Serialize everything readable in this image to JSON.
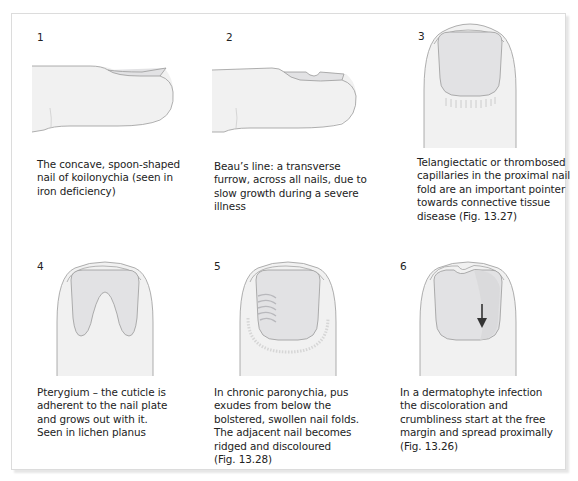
{
  "figure": {
    "panels": [
      {
        "number": "1",
        "illustration": "koilonychia-finger-side-view",
        "caption_lines": [
          "The concave, spoon-shaped",
          "nail of koilonychia (seen in",
          "iron deficiency)"
        ]
      },
      {
        "number": "2",
        "illustration": "beaus-line-finger-side-view",
        "caption_lines": [
          "Beau’s line: a transverse",
          "furrow, across all nails, due to",
          "slow growth during a severe",
          "illness"
        ]
      },
      {
        "number": "3",
        "illustration": "nailfold-capillaries-finger-top-view",
        "caption_lines": [
          "Telangiectatic or thrombosed",
          "capillaries in the proximal nail",
          "fold are an important pointer",
          "towards connective tissue",
          "disease (Fig. 13.27)"
        ]
      },
      {
        "number": "4",
        "illustration": "pterygium-finger-top-view",
        "caption_lines": [
          "Pterygium – the cuticle is",
          "adherent to the nail plate",
          "and grows out with it.",
          "Seen in lichen planus"
        ]
      },
      {
        "number": "5",
        "illustration": "chronic-paronychia-finger-top-view",
        "caption_lines": [
          "In chronic paronychia, pus",
          "exudes from below the",
          "bolstered, swollen nail folds.",
          "The adjacent nail becomes",
          "ridged and discoloured",
          "(Fig. 13.28)"
        ]
      },
      {
        "number": "6",
        "illustration": "dermatophyte-infection-finger-top-view",
        "caption_lines": [
          "In a dermatophyte infection",
          "the discoloration and",
          "crumbliness start at the free",
          "margin and spread proximally",
          "(Fig. 13.26)"
        ]
      }
    ],
    "colors": {
      "skin_fill": "#f1f1f1",
      "nail_fill": "#e2e2e4",
      "outline": "#9a9a9a",
      "arrow": "#333333",
      "frame_border": "#dcdcdc"
    }
  }
}
